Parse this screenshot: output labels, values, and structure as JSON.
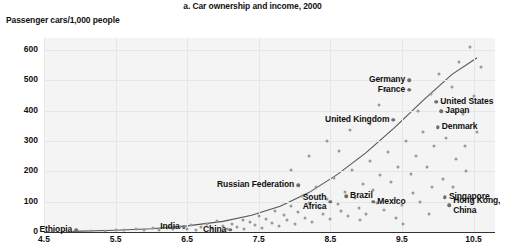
{
  "chart_data": {
    "type": "scatter",
    "title": "a. Car ownership and income, 2000",
    "ylabel": "Passenger cars/1,000 people",
    "xlabel": "",
    "xlim": [
      4.5,
      10.8
    ],
    "ylim": [
      0,
      640
    ],
    "xticks": [
      "4.5",
      "5.5",
      "6.5",
      "7.5",
      "8.5",
      "9.5",
      "10.5"
    ],
    "xtick_values": [
      4.5,
      5.5,
      6.5,
      7.5,
      8.5,
      9.5,
      10.5
    ],
    "yticks": [
      "0",
      "100",
      "200",
      "300",
      "400",
      "500",
      "600"
    ],
    "ytick_values": [
      0,
      100,
      200,
      300,
      400,
      500,
      600
    ],
    "grid": true,
    "legend": "none",
    "trend_label": "fitted curve",
    "annotations": [
      {
        "label": "Ethiopia",
        "x": 4.95,
        "y": 5,
        "align": "right"
      },
      {
        "label": "India",
        "x": 6.45,
        "y": 15,
        "align": "right"
      },
      {
        "label": "China",
        "x": 7.1,
        "y": 8,
        "align": "right"
      },
      {
        "label": "Russian Federation",
        "x": 8.05,
        "y": 155,
        "align": "right"
      },
      {
        "label": "South\nAfrica",
        "x": 8.5,
        "y": 100,
        "align": "right"
      },
      {
        "label": "Brazil",
        "x": 8.72,
        "y": 118,
        "align": "left"
      },
      {
        "label": "Mexico",
        "x": 9.1,
        "y": 100,
        "align": "left"
      },
      {
        "label": "United Kingdom",
        "x": 9.38,
        "y": 370,
        "align": "right"
      },
      {
        "label": "Germany",
        "x": 9.6,
        "y": 500,
        "align": "right"
      },
      {
        "label": "France",
        "x": 9.6,
        "y": 470,
        "align": "right"
      },
      {
        "label": "United States",
        "x": 9.98,
        "y": 430,
        "align": "left"
      },
      {
        "label": "Japan",
        "x": 10.05,
        "y": 398,
        "align": "left"
      },
      {
        "label": "Denmark",
        "x": 10.0,
        "y": 345,
        "align": "left"
      },
      {
        "label": "Singapore",
        "x": 10.1,
        "y": 115,
        "align": "left"
      },
      {
        "label": "Hong Kong,\nChina",
        "x": 10.16,
        "y": 88,
        "align": "left"
      }
    ],
    "points": [
      [
        4.95,
        2
      ],
      [
        5.15,
        4
      ],
      [
        5.35,
        3
      ],
      [
        5.5,
        6
      ],
      [
        5.62,
        5
      ],
      [
        5.78,
        10
      ],
      [
        5.9,
        7
      ],
      [
        6.02,
        12
      ],
      [
        6.1,
        6
      ],
      [
        6.22,
        14
      ],
      [
        6.3,
        9
      ],
      [
        6.4,
        18
      ],
      [
        6.5,
        11
      ],
      [
        6.55,
        22
      ],
      [
        6.62,
        8
      ],
      [
        6.7,
        16
      ],
      [
        6.78,
        28
      ],
      [
        6.85,
        13
      ],
      [
        6.92,
        35
      ],
      [
        7.0,
        20
      ],
      [
        7.05,
        10
      ],
      [
        7.12,
        26
      ],
      [
        7.2,
        17
      ],
      [
        7.28,
        40
      ],
      [
        7.3,
        9
      ],
      [
        7.38,
        32
      ],
      [
        7.45,
        22
      ],
      [
        7.5,
        52
      ],
      [
        7.55,
        14
      ],
      [
        7.6,
        44
      ],
      [
        7.68,
        30
      ],
      [
        7.72,
        70
      ],
      [
        7.78,
        20
      ],
      [
        7.85,
        55
      ],
      [
        7.9,
        38
      ],
      [
        7.95,
        86
      ],
      [
        8.0,
        28
      ],
      [
        8.05,
        65
      ],
      [
        8.1,
        118
      ],
      [
        8.15,
        45
      ],
      [
        8.2,
        95
      ],
      [
        8.25,
        34
      ],
      [
        8.3,
        150
      ],
      [
        8.35,
        78
      ],
      [
        8.4,
        58
      ],
      [
        8.45,
        110
      ],
      [
        8.5,
        42
      ],
      [
        8.55,
        178
      ],
      [
        8.6,
        92
      ],
      [
        8.65,
        68
      ],
      [
        8.7,
        132
      ],
      [
        8.75,
        52
      ],
      [
        8.8,
        205
      ],
      [
        8.85,
        112
      ],
      [
        8.9,
        80
      ],
      [
        8.95,
        160
      ],
      [
        9.0,
        58
      ],
      [
        9.05,
        235
      ],
      [
        9.1,
        140
      ],
      [
        9.15,
        95
      ],
      [
        9.2,
        188
      ],
      [
        9.25,
        72
      ],
      [
        9.3,
        265
      ],
      [
        9.35,
        165
      ],
      [
        9.38,
        370
      ],
      [
        9.4,
        110
      ],
      [
        9.45,
        215
      ],
      [
        9.5,
        88
      ],
      [
        9.55,
        300
      ],
      [
        9.6,
        500
      ],
      [
        9.6,
        470
      ],
      [
        9.62,
        190
      ],
      [
        9.65,
        128
      ],
      [
        9.7,
        250
      ],
      [
        9.72,
        400
      ],
      [
        9.75,
        98
      ],
      [
        9.8,
        330
      ],
      [
        9.85,
        215
      ],
      [
        9.9,
        455
      ],
      [
        9.92,
        148
      ],
      [
        9.95,
        285
      ],
      [
        9.98,
        430
      ],
      [
        10.0,
        345
      ],
      [
        10.02,
        520
      ],
      [
        10.05,
        398
      ],
      [
        10.08,
        175
      ],
      [
        10.1,
        115
      ],
      [
        10.12,
        310
      ],
      [
        10.16,
        88
      ],
      [
        10.2,
        480
      ],
      [
        10.25,
        240
      ],
      [
        10.3,
        560
      ],
      [
        10.35,
        390
      ],
      [
        10.4,
        200
      ],
      [
        10.45,
        610
      ],
      [
        10.5,
        450
      ],
      [
        10.55,
        330
      ],
      [
        10.6,
        545
      ],
      [
        8.2,
        250
      ],
      [
        8.45,
        300
      ],
      [
        7.95,
        205
      ],
      [
        9.18,
        420
      ],
      [
        9.05,
        355
      ],
      [
        8.78,
        335
      ],
      [
        9.28,
        470
      ],
      [
        8.62,
        268
      ],
      [
        10.22,
        150
      ],
      [
        9.88,
        60
      ],
      [
        9.42,
        45
      ],
      [
        8.92,
        38
      ],
      [
        10.38,
        285
      ],
      [
        9.52,
        25
      ]
    ],
    "trend": [
      [
        4.9,
        2
      ],
      [
        5.5,
        6
      ],
      [
        6.0,
        11
      ],
      [
        6.5,
        20
      ],
      [
        7.0,
        35
      ],
      [
        7.4,
        55
      ],
      [
        7.8,
        85
      ],
      [
        8.2,
        130
      ],
      [
        8.6,
        190
      ],
      [
        9.0,
        262
      ],
      [
        9.4,
        345
      ],
      [
        9.8,
        435
      ],
      [
        10.2,
        520
      ],
      [
        10.55,
        575
      ]
    ]
  }
}
